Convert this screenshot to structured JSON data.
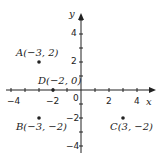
{
  "axes": {
    "x_label": "x",
    "y_label": "y",
    "origin_label": "0",
    "x_ticks": [
      {
        "value": -4,
        "label": "−4"
      },
      {
        "value": -2,
        "label": "−2"
      },
      {
        "value": 2,
        "label": "2"
      },
      {
        "value": 4,
        "label": "4"
      }
    ],
    "y_ticks": [
      {
        "value": 4,
        "label": "4"
      },
      {
        "value": 2,
        "label": "2"
      },
      {
        "value": -2,
        "label": "−2"
      },
      {
        "value": -4,
        "label": "−4"
      }
    ]
  },
  "points": [
    {
      "name": "A",
      "label": "A(−3, 2)",
      "x": -3,
      "y": 2
    },
    {
      "name": "B",
      "label": "B(−3, −2)",
      "x": -3,
      "y": -2
    },
    {
      "name": "C",
      "label": "C(3, −2)",
      "x": 3,
      "y": -2
    },
    {
      "name": "D",
      "label": "D(−2, 0)",
      "x": -2,
      "y": 0
    }
  ],
  "colors": {
    "ink": "#222222",
    "background": "#ffffff"
  }
}
